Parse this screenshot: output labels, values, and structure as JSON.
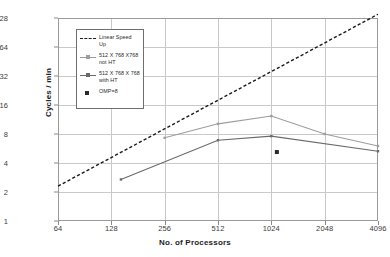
{
  "chart_data": {
    "type": "line",
    "title": "",
    "xlabel": "No. of Processors",
    "ylabel": "Cycles / min",
    "xscale": "log2",
    "yscale": "log2",
    "xlim": [
      64,
      4096
    ],
    "ylim": [
      1,
      128
    ],
    "xticks": [
      64,
      128,
      256,
      512,
      1024,
      2048,
      4096
    ],
    "xtick_labels": [
      "64",
      "128",
      "256",
      "512",
      "1024",
      "2048",
      "4096"
    ],
    "yticks": [
      1,
      2,
      4,
      8,
      16,
      32,
      64,
      128
    ],
    "ytick_labels": [
      "1",
      "2",
      "4",
      "8",
      "16",
      "32",
      "64",
      "128"
    ],
    "grid": true,
    "legend_position": "upper-left",
    "series": [
      {
        "name": "Linear Speed Up",
        "style": "dashed",
        "color": "#1a1a1a",
        "x": [
          64,
          4096
        ],
        "y": [
          2.3,
          140
        ]
      },
      {
        "name": "512 X 768 X768 not HT",
        "style": "solid",
        "color": "#9d9d9d",
        "x": [
          256,
          512,
          1024,
          2048,
          4096
        ],
        "y": [
          7.3,
          10.2,
          12.3,
          8.0,
          6.0
        ]
      },
      {
        "name": "512 X 768 X 768 with HT",
        "style": "solid",
        "color": "#6a6a6a",
        "x": [
          145,
          512,
          1024,
          4096
        ],
        "y": [
          2.7,
          6.9,
          7.6,
          5.3
        ]
      },
      {
        "name": "OMP=8",
        "style": "marker",
        "color": "#2a2a2a",
        "x": [
          1100
        ],
        "y": [
          5.2
        ]
      }
    ]
  },
  "legend": {
    "items": [
      {
        "label": "Linear Speed Up",
        "key": "dashed-line-key",
        "color": "#1a1a1a"
      },
      {
        "label": "512 X 768 X768\nnot HT",
        "key": "light-line-key",
        "color": "#9d9d9d"
      },
      {
        "label": "512 X 768 X 768\nwith HT",
        "key": "dark-line-key",
        "color": "#6a6a6a"
      },
      {
        "label": "OMP=8",
        "key": "square-marker-key",
        "color": "#2a2a2a"
      }
    ]
  },
  "axes": {
    "x_title": "No. of Processors",
    "y_title": "Cycles / min"
  }
}
